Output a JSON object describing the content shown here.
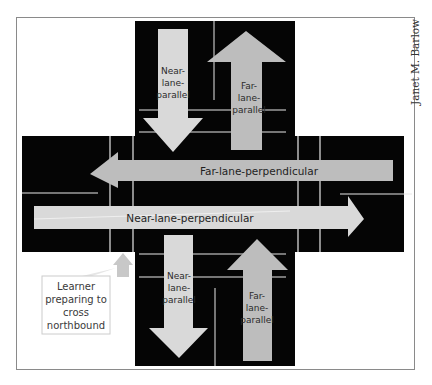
{
  "credit": "Janet M. Barlow",
  "colors": {
    "road": "#050505",
    "lane_line": "#e8e8e8",
    "near_arrow": "#d9d9d9",
    "far_arrow": "#bdbdbd",
    "frame_border": "#8a8a8a",
    "callout_border": "#cccccc",
    "learner_marker": "#c8c8c8"
  },
  "arrows": {
    "north_near": {
      "line1": "Near-",
      "line2": "lane-",
      "line3": "parallel"
    },
    "north_far": {
      "line1": "Far-",
      "line2": "lane-",
      "line3": "parallel"
    },
    "south_near": {
      "line1": "Near-",
      "line2": "lane-",
      "line3": "parallel"
    },
    "south_far": {
      "line1": "Far-",
      "line2": "lane-",
      "line3": "parallel"
    },
    "far_perpendicular": "Far-lane-perpendicular",
    "near_perpendicular": "Near-lane-perpendicular"
  },
  "callout": {
    "line1": "Learner",
    "line2": "preparing to",
    "line3": "cross",
    "line4": "northbound"
  }
}
